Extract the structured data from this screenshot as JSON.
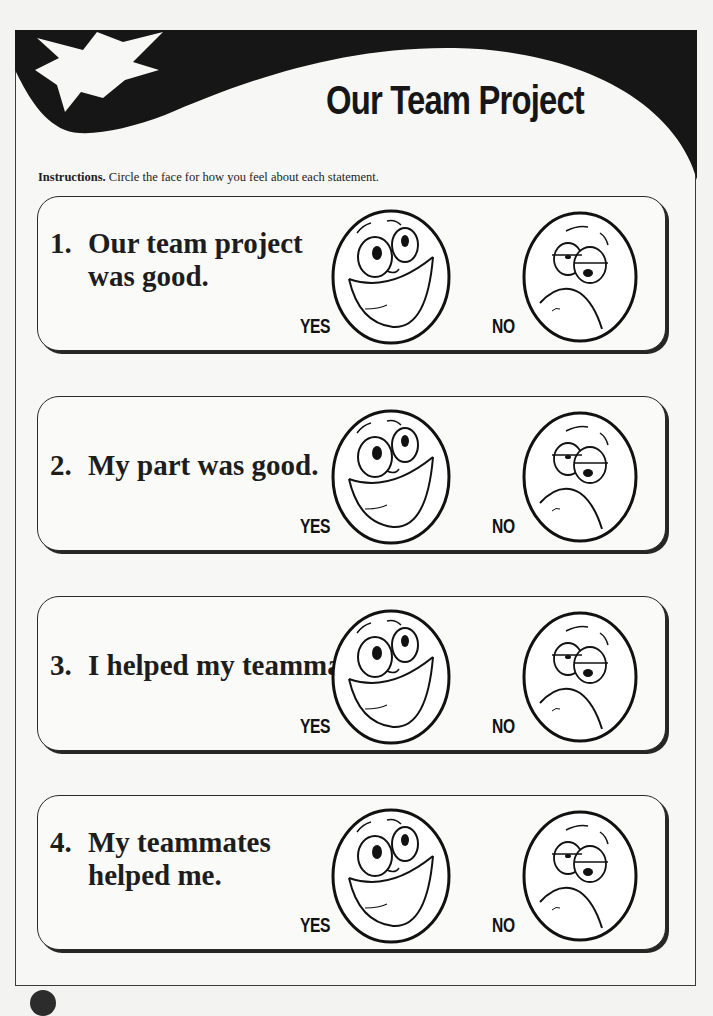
{
  "header": {
    "title": "Our Team Project",
    "decoration_icon": "starburst-icon"
  },
  "instructions": {
    "lead": "Instructions.",
    "text": " Circle the face for how you feel about each statement."
  },
  "items": [
    {
      "number": "1.",
      "line1": "Our team project",
      "line2": "was good.",
      "yes_label": "YES",
      "no_label": "NO"
    },
    {
      "number": "2.",
      "line1": "My part was good.",
      "line2": "",
      "yes_label": "YES",
      "no_label": "NO"
    },
    {
      "number": "3.",
      "line1": "I helped my teammates.",
      "line2": "",
      "yes_label": "YES",
      "no_label": "NO"
    },
    {
      "number": "4.",
      "line1": "My teammates",
      "line2": "helped me.",
      "yes_label": "YES",
      "no_label": "NO"
    }
  ],
  "colors": {
    "ink": "#1a1a1a",
    "paper": "#f7f7f5",
    "band": "#161616"
  }
}
